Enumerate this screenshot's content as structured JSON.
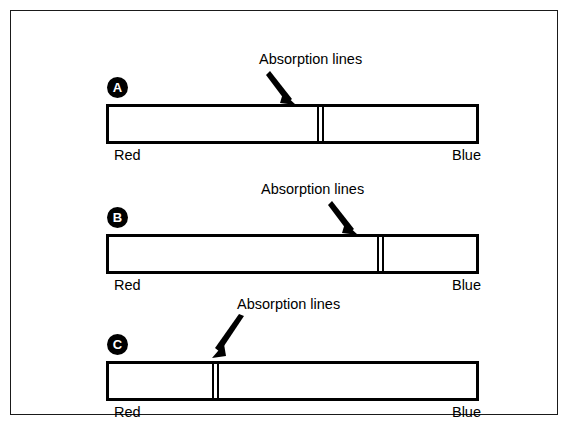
{
  "figure": {
    "background_color": "#ffffff",
    "line_color": "#000000",
    "border_color": "#1a1a1a"
  },
  "panels": [
    {
      "id": "a",
      "badge": "A",
      "callout_text": "Absorption lines",
      "red_label": "Red",
      "blue_label": "Blue",
      "line_position_pct": 57,
      "arrow_direction": "down-right",
      "callout_left_px": 248,
      "callout_top_px": 36,
      "lines_left_px": 309
    },
    {
      "id": "b",
      "badge": "B",
      "callout_text": "Absorption lines",
      "red_label": "Red",
      "blue_label": "Blue",
      "line_position_pct": 74,
      "arrow_direction": "down-right",
      "callout_left_px": 250,
      "callout_top_px": 36,
      "lines_left_px": 369
    },
    {
      "id": "c",
      "badge": "C",
      "callout_text": "Absorption lines",
      "red_label": "Red",
      "blue_label": "Blue",
      "line_position_pct": 29,
      "arrow_direction": "down-left",
      "callout_left_px": 226,
      "callout_top_px": 22,
      "lines_left_px": 204
    }
  ]
}
